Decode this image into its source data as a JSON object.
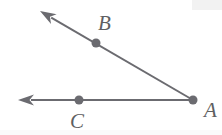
{
  "figure": {
    "kind": "geometry-diagram",
    "background_color": "#ffffff",
    "stroke_color": "#6b6b70",
    "label_color": "#5f5f62",
    "stroke_width": 2,
    "dot_radius": 4,
    "canvas": {
      "width": 222,
      "height": 135
    },
    "points": [
      {
        "id": "A",
        "label": "A",
        "x": 193,
        "y": 100,
        "dot": true,
        "label_x": 204,
        "label_y": 117
      },
      {
        "id": "B",
        "label": "B",
        "x": 96,
        "y": 43,
        "dot": true,
        "label_x": 98,
        "label_y": 30
      },
      {
        "id": "C",
        "label": "C",
        "x": 79,
        "y": 100,
        "dot": true,
        "label_x": 70,
        "label_y": 128
      }
    ],
    "rays": [
      {
        "id": "ray-AB",
        "from": "A",
        "through": "B",
        "start_x": 193,
        "start_y": 100,
        "end_x": 40,
        "end_y": 11,
        "arrowhead": "end"
      },
      {
        "id": "ray-AC",
        "from": "A",
        "through": "C",
        "start_x": 193,
        "start_y": 100,
        "end_x": 18,
        "end_y": 100,
        "arrowhead": "end"
      }
    ]
  }
}
